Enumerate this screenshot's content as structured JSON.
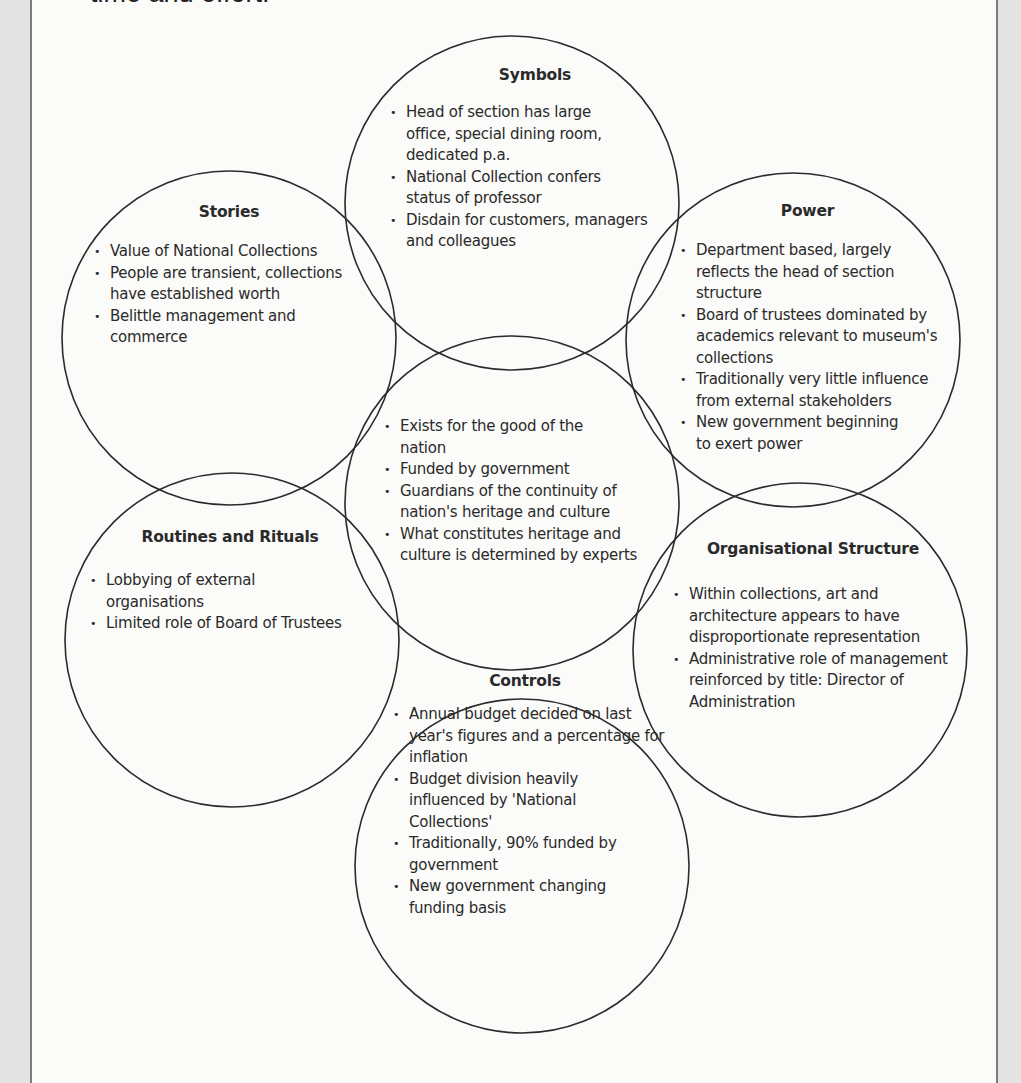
{
  "intro_text": "time and effort.",
  "diagram": {
    "type": "cultural-web",
    "stroke_color": "#2b2b2b",
    "circles": [
      {
        "id": "symbols",
        "title": "Symbols",
        "items": [
          "Head of section has large office, special dining room, dedicated p.a.",
          "National Collection confers status of professor",
          "Disdain for customers, managers and colleagues"
        ]
      },
      {
        "id": "stories",
        "title": "Stories",
        "items": [
          "Value of National Collections",
          "People are transient, collections have established worth",
          "Belittle management and commerce"
        ]
      },
      {
        "id": "power",
        "title": "Power",
        "items": [
          "Department based, largely reflects the head of section structure",
          "Board of trustees dominated by academics relevant to museum's collections",
          "Traditionally very little influence from external stakeholders",
          "New government beginning to exert power"
        ]
      },
      {
        "id": "paradigm",
        "title": "",
        "items": [
          "Exists for the good of the nation",
          "Funded by government",
          "Guardians of the continuity of nation's heritage and culture",
          "What constitutes heritage and culture is determined by experts"
        ]
      },
      {
        "id": "routines",
        "title": "Routines and Rituals",
        "items": [
          "Lobbying of external organisations",
          "Limited role of Board of Trustees"
        ]
      },
      {
        "id": "org-structure",
        "title": "Organisational Structure",
        "items": [
          "Within collections, art and architecture appears to have disproportionate representation",
          "Administrative role of management reinforced by title: Director of Administration"
        ]
      },
      {
        "id": "controls",
        "title": "Controls",
        "items": [
          "Annual budget decided on last year's figures and a percentage for inflation",
          "Budget division heavily influenced by 'National Collections'",
          "Traditionally, 90% funded by government",
          "New government changing funding basis"
        ]
      }
    ]
  }
}
